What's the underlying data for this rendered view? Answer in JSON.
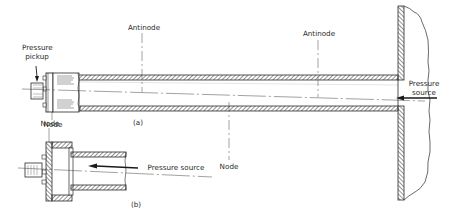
{
  "figure": {
    "part_a": {
      "caption": "(a)",
      "labels": {
        "pressure_pickup": [
          "Pressure",
          "pickup"
        ],
        "antinode_left": "Antinode",
        "antinode_right": "Antinode",
        "node_left": "Node",
        "node_middle": "Node",
        "pressure_source": [
          "Pressure",
          "source"
        ]
      }
    },
    "part_b": {
      "caption": "(b)",
      "labels": {
        "node": "Node",
        "pressure_source": "Pressure source"
      }
    },
    "colors": {
      "line": "#2a2a2a",
      "background": "#ffffff"
    }
  }
}
